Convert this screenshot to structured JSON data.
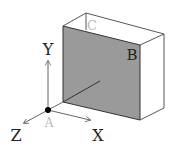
{
  "diagram": {
    "type": "3d-coordinate-plane",
    "axes": {
      "x_label": "X",
      "y_label": "Y",
      "z_label": "Z"
    },
    "points": {
      "origin_label": "A",
      "panel_label": "B",
      "back_corner_label": "C"
    },
    "colors": {
      "panel_fill": "#9a9a9a",
      "line": "#333333",
      "axis": "#555555",
      "faint_label": "#bbbbbb",
      "label": "#222222"
    }
  }
}
